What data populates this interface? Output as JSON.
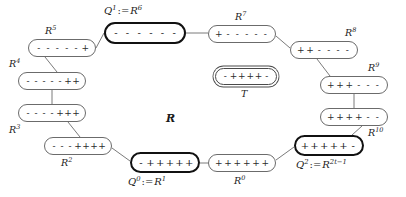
{
  "figure": {
    "center_label": "R",
    "background_color": "#ffffff",
    "line_color": "#6b6b6b",
    "bold_color": "#111111",
    "text_color": "#2b2b2b"
  },
  "nodes": [
    {
      "id": "R6",
      "label_html": "Q<sup>1</sup> := R<sup>6</sup>",
      "label_base": "Q",
      "label_sup": "1",
      "label_assign": ":=",
      "label_alias_base": "R",
      "label_alias_sup": "6",
      "label_text": "Q1 := R6",
      "signs": [
        "-",
        "-",
        "-",
        "-",
        "-",
        "-"
      ],
      "style": "bold",
      "x": 104,
      "y": 22,
      "w": 82,
      "h": 22,
      "label_x": 104,
      "label_y": 5
    },
    {
      "id": "R5",
      "label_base": "R",
      "label_sup": "5",
      "label_text": "R5",
      "signs": [
        "-",
        "-",
        "-",
        "-",
        "-",
        "+"
      ],
      "style": "normal",
      "x": 28,
      "y": 39,
      "w": 68,
      "h": 18,
      "label_x": 45,
      "label_y": 25
    },
    {
      "id": "R4",
      "label_base": "R",
      "label_sup": "4",
      "label_text": "R4",
      "signs": [
        "-",
        "-",
        "-",
        "-",
        "-",
        "+",
        "+"
      ],
      "style": "normal",
      "x": 18,
      "y": 72,
      "w": 68,
      "h": 18,
      "label_x": 9,
      "label_y": 58
    },
    {
      "id": "R3",
      "label_base": "R",
      "label_sup": "3",
      "label_text": "R3",
      "signs": [
        "-",
        "-",
        "-",
        "-",
        "+",
        "+",
        "+"
      ],
      "style": "normal",
      "x": 18,
      "y": 104,
      "w": 68,
      "h": 18,
      "label_x": 9,
      "label_y": 124
    },
    {
      "id": "R2",
      "label_base": "R",
      "label_sup": "2",
      "label_text": "R2",
      "signs": [
        "-",
        "-",
        "-",
        "+",
        "+",
        "+",
        "+"
      ],
      "style": "normal",
      "x": 44,
      "y": 137,
      "w": 68,
      "h": 18,
      "label_x": 61,
      "label_y": 157
    },
    {
      "id": "R1",
      "label_html": "Q<sup>0</sup> := R<sup>1</sup>",
      "label_base": "Q",
      "label_sup": "0",
      "label_assign": ":=",
      "label_alias_base": "R",
      "label_alias_sup": "1",
      "label_text": "Q0 := R1",
      "signs": [
        "-",
        "+",
        "+",
        "+",
        "+",
        "+"
      ],
      "style": "bold",
      "x": 130,
      "y": 152,
      "w": 70,
      "h": 21,
      "label_x": 128,
      "label_y": 176
    },
    {
      "id": "R0",
      "label_base": "R",
      "label_sup": "0",
      "label_text": "R0",
      "signs": [
        "+",
        "+",
        "+",
        "+",
        "+",
        "+"
      ],
      "style": "normal",
      "x": 208,
      "y": 154,
      "w": 68,
      "h": 18,
      "label_x": 234,
      "label_y": 175
    },
    {
      "id": "R2t-1",
      "label_html": "Q<sup>2</sup> := R<sup>2t-1</sup>",
      "label_base": "Q",
      "label_sup": "2",
      "label_assign": ":=",
      "label_alias_base": "R",
      "label_alias_sup": "2t−1",
      "label_text": "Q2 := R2t-1",
      "signs": [
        "+",
        "+",
        "+",
        "+",
        "+",
        "-"
      ],
      "style": "bold",
      "x": 294,
      "y": 135,
      "w": 70,
      "h": 21,
      "label_x": 296,
      "label_y": 159
    },
    {
      "id": "R10",
      "label_base": "R",
      "label_sup": "10",
      "label_text": "R10",
      "signs": [
        "+",
        "+",
        "+",
        "+",
        "-",
        "-"
      ],
      "style": "normal",
      "x": 320,
      "y": 108,
      "w": 68,
      "h": 18,
      "label_x": 368,
      "label_y": 127
    },
    {
      "id": "R9",
      "label_base": "R",
      "label_sup": "9",
      "label_text": "R9",
      "signs": [
        "+",
        "+",
        "+",
        "-",
        "-",
        "-"
      ],
      "style": "normal",
      "x": 320,
      "y": 76,
      "w": 68,
      "h": 18,
      "label_x": 368,
      "label_y": 62
    },
    {
      "id": "R8",
      "label_base": "R",
      "label_sup": "8",
      "label_text": "R8",
      "signs": [
        "+",
        "+",
        "-",
        "-",
        "-",
        "-"
      ],
      "style": "normal",
      "x": 290,
      "y": 41,
      "w": 68,
      "h": 18,
      "label_x": 345,
      "label_y": 27
    },
    {
      "id": "R7",
      "label_base": "R",
      "label_sup": "7",
      "label_text": "R7",
      "signs": [
        "+",
        "-",
        "-",
        "-",
        "-",
        "-"
      ],
      "style": "normal",
      "x": 208,
      "y": 25,
      "w": 68,
      "h": 18,
      "label_x": 235,
      "label_y": 11
    },
    {
      "id": "T",
      "label_base": "T",
      "label_sup": "",
      "label_text": "T",
      "signs": [
        "-",
        "+",
        "+",
        "+",
        "+",
        "-"
      ],
      "style": "double",
      "x": 215,
      "y": 68,
      "w": 62,
      "h": 17,
      "label_x": 241,
      "label_y": 88
    }
  ],
  "edges": [
    {
      "from": "R5",
      "to": "R6",
      "path": "M 96,48 L 104,33"
    },
    {
      "from": "R4",
      "to": "R5",
      "path": "M 57,72 L 45,57"
    },
    {
      "from": "R4",
      "to": "R3",
      "path": "M 52,90 L 52,104"
    },
    {
      "from": "R3",
      "to": "R2",
      "path": "M 68,122 L 80,137"
    },
    {
      "from": "R2",
      "to": "R1",
      "path": "M 112,148 L 130,161"
    },
    {
      "from": "R1",
      "to": "R0",
      "path": "M 200,163 L 208,163"
    },
    {
      "from": "R0",
      "to": "R2t-1",
      "path": "M 276,160 L 294,147"
    },
    {
      "from": "R2t-1",
      "to": "R10",
      "path": "M 352,135 L 362,126"
    },
    {
      "from": "R10",
      "to": "R9",
      "path": "M 354,108 L 354,94"
    },
    {
      "from": "R9",
      "to": "R8",
      "path": "M 330,76 L 317,59"
    },
    {
      "from": "R8",
      "to": "R7",
      "path": "M 290,48 L 276,36"
    },
    {
      "from": "R7",
      "to": "R6",
      "path": "M 208,33 L 186,33"
    }
  ],
  "center_label": {
    "text": "R",
    "x": 166,
    "y": 112
  }
}
